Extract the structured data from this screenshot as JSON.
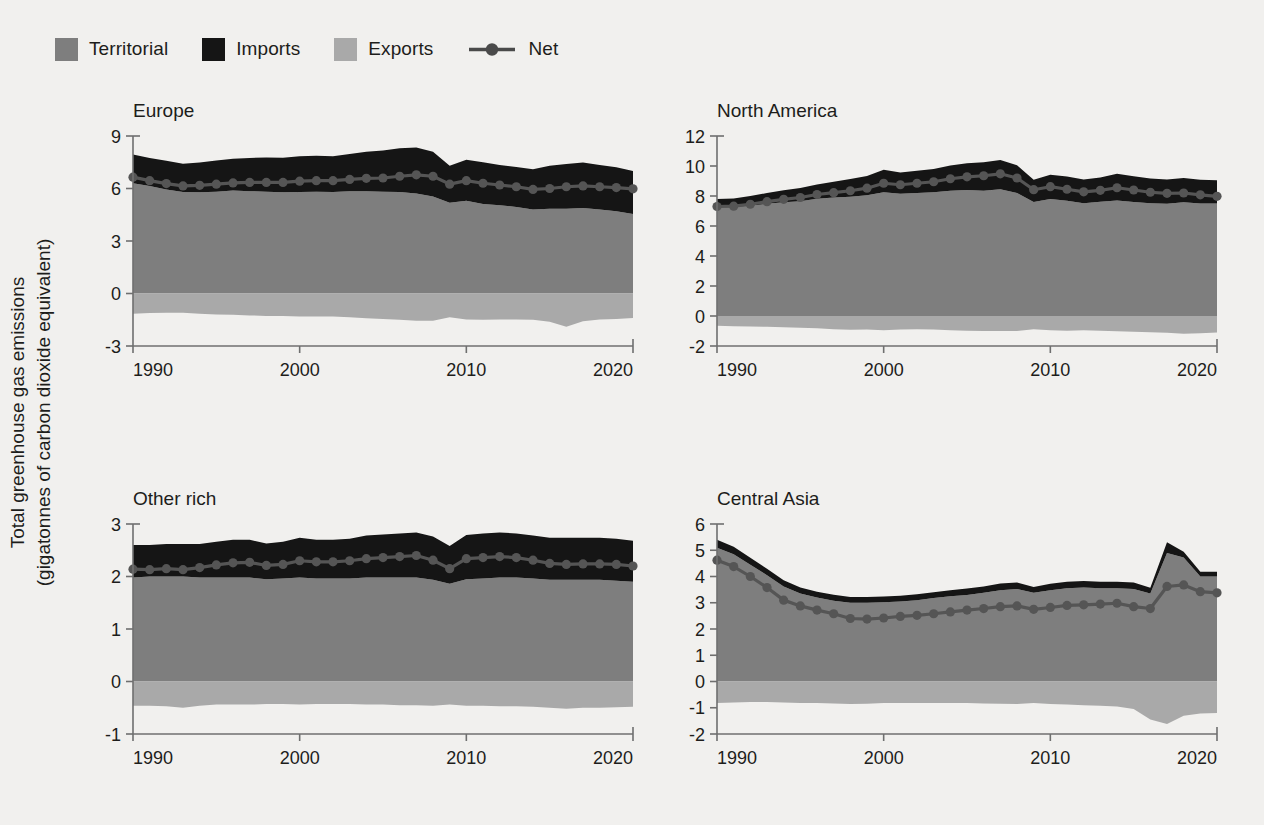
{
  "figure": {
    "y_axis_title_line1": "Total greenhouse gas emissions",
    "y_axis_title_line2": "(gigatonnes of carbon dioxide equivalent)",
    "background_color": "#f1f0ee"
  },
  "legend": {
    "position": "top-left",
    "items": [
      {
        "label": "Territorial",
        "color": "#7e7e7e",
        "marker": "square"
      },
      {
        "label": "Imports",
        "color": "#151515",
        "marker": "square"
      },
      {
        "label": "Exports",
        "color": "#a9a9a9",
        "marker": "square"
      },
      {
        "label": "Net",
        "color": "#555555",
        "marker": "line-point"
      }
    ]
  },
  "chart_data": [
    {
      "type": "area",
      "title": "Europe",
      "xlabel": "",
      "ylabel": "Total greenhouse gas emissions (gigatonnes of carbon dioxide equivalent)",
      "xlim": [
        1990,
        2020
      ],
      "ylim": [
        -3,
        9
      ],
      "xticks": [
        1990,
        2000,
        2010,
        2020
      ],
      "yticks": [
        -3,
        0,
        3,
        6,
        9
      ],
      "grid": false,
      "x": [
        1990,
        1991,
        1992,
        1993,
        1994,
        1995,
        1996,
        1997,
        1998,
        1999,
        2000,
        2001,
        2002,
        2003,
        2004,
        2005,
        2006,
        2007,
        2008,
        2009,
        2010,
        2011,
        2012,
        2013,
        2014,
        2015,
        2016,
        2017,
        2018,
        2019,
        2020
      ],
      "series": [
        {
          "name": "Territorial",
          "color": "#7e7e7e",
          "values": [
            6.3,
            6.15,
            5.95,
            5.8,
            5.78,
            5.82,
            5.88,
            5.85,
            5.82,
            5.78,
            5.8,
            5.82,
            5.8,
            5.85,
            5.85,
            5.82,
            5.8,
            5.72,
            5.55,
            5.18,
            5.3,
            5.12,
            5.05,
            4.95,
            4.8,
            4.85,
            4.85,
            4.88,
            4.8,
            4.7,
            4.55
          ]
        },
        {
          "name": "Imports",
          "color": "#151515",
          "values": [
            1.65,
            1.6,
            1.63,
            1.62,
            1.7,
            1.78,
            1.82,
            1.9,
            1.95,
            1.98,
            2.05,
            2.05,
            2.05,
            2.12,
            2.25,
            2.35,
            2.5,
            2.62,
            2.55,
            2.12,
            2.35,
            2.38,
            2.3,
            2.28,
            2.3,
            2.45,
            2.55,
            2.6,
            2.55,
            2.52,
            2.45
          ]
        },
        {
          "name": "Exports",
          "color": "#a9a9a9",
          "values": [
            -1.15,
            -1.12,
            -1.1,
            -1.1,
            -1.15,
            -1.2,
            -1.22,
            -1.25,
            -1.28,
            -1.28,
            -1.32,
            -1.32,
            -1.32,
            -1.35,
            -1.42,
            -1.45,
            -1.5,
            -1.55,
            -1.55,
            -1.35,
            -1.48,
            -1.5,
            -1.48,
            -1.48,
            -1.5,
            -1.62,
            -1.9,
            -1.58,
            -1.48,
            -1.45,
            -1.4
          ]
        },
        {
          "name": "Net",
          "color": "#555555",
          "values": [
            6.65,
            6.45,
            6.28,
            6.15,
            6.18,
            6.25,
            6.32,
            6.35,
            6.35,
            6.35,
            6.42,
            6.45,
            6.45,
            6.52,
            6.58,
            6.6,
            6.7,
            6.78,
            6.7,
            6.25,
            6.45,
            6.3,
            6.2,
            6.1,
            5.95,
            6.0,
            6.1,
            6.15,
            6.1,
            6.05,
            5.98
          ]
        }
      ]
    },
    {
      "type": "area",
      "title": "North America",
      "xlabel": "",
      "ylabel": "",
      "xlim": [
        1990,
        2020
      ],
      "ylim": [
        -2,
        12
      ],
      "xticks": [
        1990,
        2000,
        2010,
        2020
      ],
      "yticks": [
        -2,
        0,
        2,
        4,
        6,
        8,
        10,
        12
      ],
      "grid": false,
      "x": [
        1990,
        1991,
        1992,
        1993,
        1994,
        1995,
        1996,
        1997,
        1998,
        1999,
        2000,
        2001,
        2002,
        2003,
        2004,
        2005,
        2006,
        2007,
        2008,
        2009,
        2010,
        2011,
        2012,
        2013,
        2014,
        2015,
        2016,
        2017,
        2018,
        2019,
        2020
      ],
      "series": [
        {
          "name": "Territorial",
          "color": "#7e7e7e",
          "values": [
            7.25,
            7.25,
            7.35,
            7.48,
            7.58,
            7.65,
            7.82,
            7.9,
            7.95,
            8.05,
            8.25,
            8.15,
            8.2,
            8.25,
            8.35,
            8.4,
            8.35,
            8.45,
            8.2,
            7.6,
            7.8,
            7.68,
            7.52,
            7.62,
            7.7,
            7.6,
            7.52,
            7.48,
            7.58,
            7.5,
            7.5
          ]
        },
        {
          "name": "Imports",
          "color": "#151515",
          "values": [
            0.55,
            0.58,
            0.65,
            0.72,
            0.8,
            0.88,
            0.95,
            1.05,
            1.18,
            1.28,
            1.5,
            1.42,
            1.48,
            1.55,
            1.68,
            1.78,
            1.9,
            1.95,
            1.85,
            1.48,
            1.62,
            1.62,
            1.58,
            1.62,
            1.78,
            1.72,
            1.65,
            1.62,
            1.62,
            1.58,
            1.55
          ]
        },
        {
          "name": "Exports",
          "color": "#a9a9a9",
          "values": [
            -0.65,
            -0.68,
            -0.7,
            -0.72,
            -0.75,
            -0.78,
            -0.82,
            -0.88,
            -0.92,
            -0.9,
            -0.95,
            -0.9,
            -0.88,
            -0.9,
            -0.95,
            -0.98,
            -1.0,
            -1.0,
            -1.0,
            -0.88,
            -0.95,
            -0.98,
            -0.95,
            -0.98,
            -1.02,
            -1.05,
            -1.08,
            -1.12,
            -1.18,
            -1.15,
            -1.1
          ]
        },
        {
          "name": "Net",
          "color": "#555555",
          "values": [
            7.3,
            7.32,
            7.45,
            7.62,
            7.78,
            7.9,
            8.1,
            8.22,
            8.35,
            8.52,
            8.85,
            8.75,
            8.85,
            8.95,
            9.15,
            9.28,
            9.35,
            9.48,
            9.2,
            8.42,
            8.62,
            8.45,
            8.28,
            8.38,
            8.55,
            8.4,
            8.25,
            8.18,
            8.2,
            8.08,
            7.98
          ]
        }
      ]
    },
    {
      "type": "area",
      "title": "Other rich",
      "xlabel": "",
      "ylabel": "",
      "xlim": [
        1990,
        2020
      ],
      "ylim": [
        -1,
        3
      ],
      "xticks": [
        1990,
        2000,
        2010,
        2020
      ],
      "yticks": [
        -1,
        0,
        1,
        2,
        3
      ],
      "grid": false,
      "x": [
        1990,
        1991,
        1992,
        1993,
        1994,
        1995,
        1996,
        1997,
        1998,
        1999,
        2000,
        2001,
        2002,
        2003,
        2004,
        2005,
        2006,
        2007,
        2008,
        2009,
        2010,
        2011,
        2012,
        2013,
        2014,
        2015,
        2016,
        2017,
        2018,
        2019,
        2020
      ],
      "series": [
        {
          "name": "Territorial",
          "color": "#7e7e7e",
          "values": [
            1.98,
            2.0,
            2.0,
            2.0,
            1.98,
            1.98,
            1.98,
            1.98,
            1.95,
            1.96,
            1.98,
            1.96,
            1.96,
            1.96,
            1.98,
            1.98,
            1.98,
            1.98,
            1.94,
            1.86,
            1.95,
            1.96,
            1.98,
            1.98,
            1.96,
            1.94,
            1.94,
            1.94,
            1.94,
            1.92,
            1.9
          ]
        },
        {
          "name": "Imports",
          "color": "#151515",
          "values": [
            0.62,
            0.6,
            0.62,
            0.62,
            0.64,
            0.68,
            0.72,
            0.72,
            0.68,
            0.7,
            0.76,
            0.74,
            0.74,
            0.76,
            0.8,
            0.82,
            0.84,
            0.86,
            0.82,
            0.72,
            0.84,
            0.86,
            0.86,
            0.84,
            0.82,
            0.8,
            0.8,
            0.8,
            0.8,
            0.8,
            0.78
          ]
        },
        {
          "name": "Exports",
          "color": "#a9a9a9",
          "values": [
            -0.46,
            -0.46,
            -0.47,
            -0.5,
            -0.46,
            -0.44,
            -0.44,
            -0.44,
            -0.43,
            -0.43,
            -0.44,
            -0.43,
            -0.43,
            -0.43,
            -0.44,
            -0.44,
            -0.45,
            -0.45,
            -0.46,
            -0.44,
            -0.46,
            -0.46,
            -0.47,
            -0.47,
            -0.48,
            -0.5,
            -0.52,
            -0.5,
            -0.5,
            -0.49,
            -0.48
          ]
        },
        {
          "name": "Net",
          "color": "#555555",
          "values": [
            2.14,
            2.13,
            2.15,
            2.13,
            2.17,
            2.22,
            2.26,
            2.27,
            2.21,
            2.23,
            2.3,
            2.28,
            2.28,
            2.3,
            2.34,
            2.36,
            2.38,
            2.4,
            2.31,
            2.15,
            2.34,
            2.36,
            2.38,
            2.36,
            2.31,
            2.25,
            2.23,
            2.24,
            2.24,
            2.23,
            2.2
          ]
        }
      ]
    },
    {
      "type": "area",
      "title": "Central Asia",
      "xlabel": "",
      "ylabel": "",
      "xlim": [
        1990,
        2020
      ],
      "ylim": [
        -2,
        6
      ],
      "xticks": [
        1990,
        2000,
        2010,
        2020
      ],
      "yticks": [
        -2,
        -1,
        0,
        1,
        2,
        3,
        4,
        5,
        6
      ],
      "grid": false,
      "x": [
        1990,
        1991,
        1992,
        1993,
        1994,
        1995,
        1996,
        1997,
        1998,
        1999,
        2000,
        2001,
        2002,
        2003,
        2004,
        2005,
        2006,
        2007,
        2008,
        2009,
        2010,
        2011,
        2012,
        2013,
        2014,
        2015,
        2016,
        2017,
        2018,
        2019,
        2020
      ],
      "series": [
        {
          "name": "Territorial",
          "color": "#7e7e7e",
          "values": [
            5.1,
            4.85,
            4.45,
            4.05,
            3.62,
            3.35,
            3.2,
            3.08,
            3.0,
            3.0,
            3.02,
            3.05,
            3.1,
            3.18,
            3.25,
            3.3,
            3.38,
            3.48,
            3.52,
            3.38,
            3.48,
            3.55,
            3.58,
            3.55,
            3.55,
            3.52,
            3.35,
            4.9,
            4.72,
            4.0,
            4.0
          ]
        },
        {
          "name": "Imports",
          "color": "#151515",
          "values": [
            0.3,
            0.28,
            0.26,
            0.25,
            0.24,
            0.23,
            0.22,
            0.22,
            0.22,
            0.22,
            0.22,
            0.22,
            0.22,
            0.22,
            0.23,
            0.24,
            0.24,
            0.25,
            0.25,
            0.22,
            0.24,
            0.25,
            0.25,
            0.25,
            0.25,
            0.25,
            0.22,
            0.4,
            0.22,
            0.18,
            0.18
          ]
        },
        {
          "name": "Exports",
          "color": "#a9a9a9",
          "values": [
            -0.82,
            -0.8,
            -0.78,
            -0.78,
            -0.8,
            -0.82,
            -0.82,
            -0.84,
            -0.86,
            -0.85,
            -0.82,
            -0.82,
            -0.82,
            -0.82,
            -0.82,
            -0.82,
            -0.84,
            -0.85,
            -0.86,
            -0.82,
            -0.86,
            -0.88,
            -0.9,
            -0.92,
            -0.95,
            -1.05,
            -1.45,
            -1.62,
            -1.3,
            -1.22,
            -1.2
          ]
        },
        {
          "name": "Net",
          "color": "#555555",
          "values": [
            4.62,
            4.38,
            4.0,
            3.58,
            3.1,
            2.88,
            2.72,
            2.58,
            2.4,
            2.38,
            2.42,
            2.48,
            2.52,
            2.58,
            2.65,
            2.72,
            2.78,
            2.85,
            2.88,
            2.75,
            2.82,
            2.9,
            2.92,
            2.95,
            2.98,
            2.85,
            2.78,
            3.62,
            3.68,
            3.42,
            3.38
          ]
        }
      ]
    }
  ]
}
